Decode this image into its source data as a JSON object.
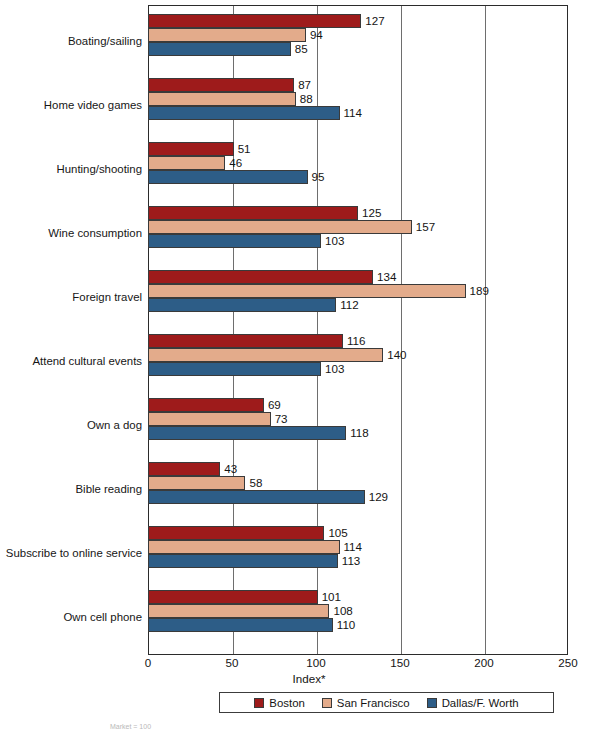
{
  "chart_data": {
    "type": "bar",
    "orientation": "horizontal",
    "title": "",
    "xlabel": "Index*",
    "ylabel": "",
    "xlim": [
      0,
      250
    ],
    "xticks": [
      0,
      50,
      100,
      150,
      200,
      250
    ],
    "grid": true,
    "gridlines_at": [
      50,
      100,
      150,
      200
    ],
    "legend_position": "bottom",
    "categories": [
      "Boating/sailing",
      "Home video games",
      "Hunting/shooting",
      "Wine consumption",
      "Foreign travel",
      "Attend cultural events",
      "Own a dog",
      "Bible reading",
      "Subscribe to online service",
      "Own cell phone"
    ],
    "series": [
      {
        "name": "Boston",
        "color": "#9e1b1b",
        "values": [
          127,
          87,
          51,
          125,
          134,
          116,
          69,
          43,
          105,
          101
        ]
      },
      {
        "name": "San Francisco",
        "color": "#e3ab8b",
        "values": [
          94,
          88,
          46,
          157,
          189,
          140,
          73,
          58,
          114,
          108
        ]
      },
      {
        "name": "Dallas/F. Worth",
        "color": "#2d5d87",
        "values": [
          85,
          114,
          95,
          103,
          112,
          103,
          118,
          129,
          113,
          110
        ]
      }
    ],
    "footnote": "Market = 100"
  }
}
